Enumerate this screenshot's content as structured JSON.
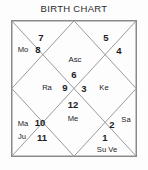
{
  "title": "BIRTH CHART",
  "chart": {
    "style": "north-indian-kundali",
    "border_color": "#8a8a8a",
    "line_color": "#9a9a9a",
    "text_color": "#1c1c1c",
    "background": "#fdfdfd",
    "houses": [
      {
        "number": "1",
        "planets": "Su Ve"
      },
      {
        "number": "2",
        "planets": "Sa"
      },
      {
        "number": "3",
        "planets": "Ke"
      },
      {
        "number": "4",
        "planets": ""
      },
      {
        "number": "5",
        "planets": ""
      },
      {
        "number": "6",
        "planets": "Asc"
      },
      {
        "number": "7",
        "planets": ""
      },
      {
        "number": "8",
        "planets": "Mo"
      },
      {
        "number": "9",
        "planets": "Ra"
      },
      {
        "number": "10",
        "planets": "Ma"
      },
      {
        "number": "11",
        "planets": "Ju"
      },
      {
        "number": "12",
        "planets": "Me"
      }
    ],
    "labels": {
      "house1_num": "1",
      "house1_planets": "Su Ve",
      "house2_num": "2",
      "house2_planets": "Sa",
      "house3_num": "3",
      "house3_planets": "Ke",
      "house4_num": "4",
      "house5_num": "5",
      "house6_num": "6",
      "house6_planets": "Asc",
      "house7_num": "7",
      "house8_num": "8",
      "house8_planets": "Mo",
      "house9_num": "9",
      "house9_planets": "Ra",
      "house10_num": "10",
      "house10_planets": "Ma",
      "house11_num": "11",
      "house11_planets": "Ju",
      "house12_num": "12",
      "house12_planets": "Me"
    }
  }
}
